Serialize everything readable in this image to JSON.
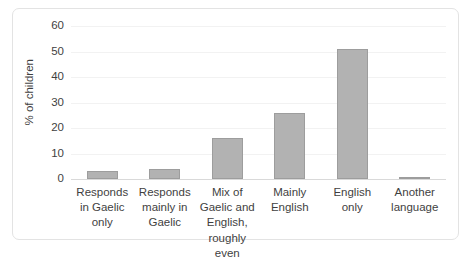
{
  "chart_data": {
    "type": "bar",
    "title": "",
    "subtitle": "",
    "xlabel": "",
    "ylabel": "% of children",
    "categories": [
      "Responds in Gaelic only",
      "Responds mainly in Gaelic",
      "Mix of Gaelic and English, roughly even",
      "Mainly English",
      "English only",
      "Another language"
    ],
    "values": [
      3,
      4,
      16,
      26,
      51,
      0.5
    ],
    "ylim": [
      0,
      60
    ],
    "yticks": [
      0,
      10,
      20,
      30,
      40,
      50,
      60
    ],
    "ytick_labels": [
      "0",
      "10",
      "20",
      "30",
      "40",
      "50",
      "60"
    ],
    "grid": true,
    "legend": "none",
    "bar_color": "#b2b2b2",
    "bar_border_color": "#9d9d9d",
    "gridline_color": "#f2f2f2",
    "axis_color": "#d9d9d9",
    "text_color": "#3f3f3f",
    "frame_border_color": "#e3e3e3",
    "background_color": "#ffffff"
  }
}
